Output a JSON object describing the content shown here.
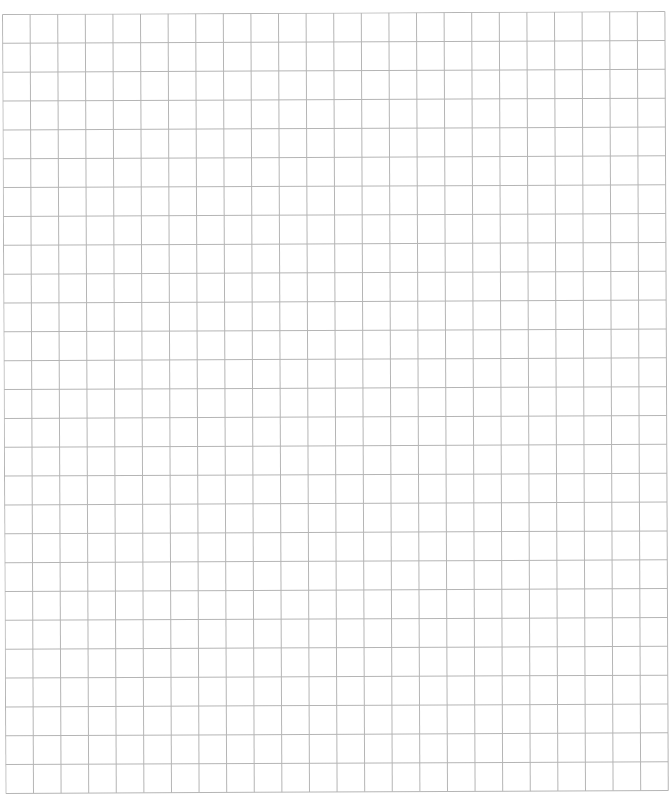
{
  "sheet": {
    "type": "grid-paper",
    "columns": 24,
    "rows": 27,
    "cell_width": 27.6,
    "cell_height": 28.85,
    "line_color": "#b5b5b5",
    "background": "#ffffff"
  }
}
